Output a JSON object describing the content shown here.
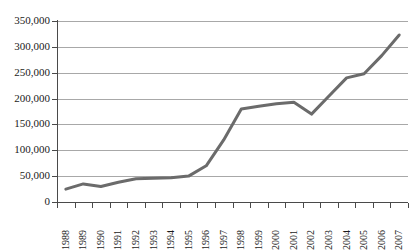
{
  "chart_data": {
    "type": "line",
    "title": "",
    "subtitle": "",
    "xlabel": "",
    "ylabel": "",
    "categories": [
      "1988",
      "1989",
      "1990",
      "1991",
      "1992",
      "1993",
      "1994",
      "1995",
      "1996",
      "1997",
      "1998",
      "1999",
      "2000",
      "2001",
      "2002",
      "2003",
      "2004",
      "2005",
      "2006",
      "2007"
    ],
    "series": [
      {
        "name": "series-1",
        "color": "#6b6b6b",
        "values": [
          25000,
          35000,
          30000,
          38000,
          45000,
          46000,
          47000,
          50000,
          70000,
          120000,
          180000,
          185000,
          190000,
          193000,
          170000,
          205000,
          240000,
          248000,
          283000,
          323000
        ]
      }
    ],
    "ylim": [
      0,
      350000
    ],
    "yticks": [
      0,
      50000,
      100000,
      150000,
      200000,
      250000,
      300000,
      350000
    ],
    "ytick_labels": [
      "0",
      "50,000",
      "100,000",
      "150,000",
      "200,000",
      "250,000",
      "300,000",
      "350,000"
    ],
    "grid": "horizontal",
    "legend": "none",
    "markers": "none",
    "annotations": []
  },
  "style": {
    "background": "#ffffff",
    "line_color": "#6b6b6b",
    "gridline_color": "#a8a8a8",
    "axis_color": "#4a4a4a",
    "text_color": "#1a1a1a"
  }
}
